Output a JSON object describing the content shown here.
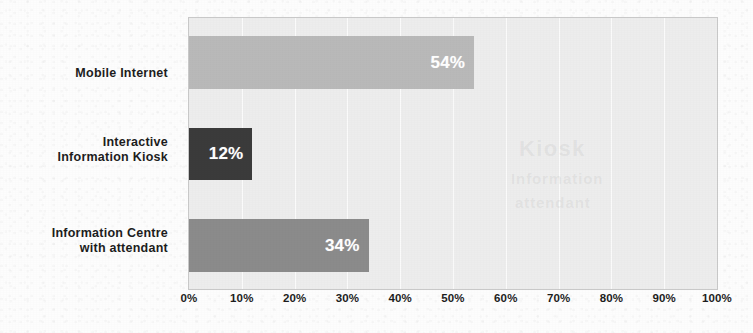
{
  "chart_data": {
    "type": "bar",
    "orientation": "horizontal",
    "title": "",
    "subtitle": "",
    "xlabel": "",
    "ylabel": "",
    "xlim": [
      0,
      100
    ],
    "xtick_labels": [
      "0%",
      "10%",
      "20%",
      "30%",
      "40%",
      "50%",
      "60%",
      "70%",
      "80%",
      "90%",
      "100%"
    ],
    "xtick_values": [
      0,
      10,
      20,
      30,
      40,
      50,
      60,
      70,
      80,
      90,
      100
    ],
    "grid": true,
    "grid_axis": "x",
    "legend": false,
    "legend_position": "none",
    "categories": [
      "Mobile Internet",
      "Interactive Information Kiosk",
      "Information Centre with attendant"
    ],
    "values": [
      54,
      12,
      34
    ],
    "data_labels": [
      "54%",
      "12%",
      "34%"
    ],
    "bars": [
      {
        "category_lines": [
          "Mobile Internet"
        ],
        "value": 54,
        "label": "54%",
        "color": "#b9b9b9",
        "label_color": "#ffffff"
      },
      {
        "category_lines": [
          "Interactive",
          "Information Kiosk"
        ],
        "value": 12,
        "label": "12%",
        "color": "#3b3b3b",
        "label_color": "#ffffff"
      },
      {
        "category_lines": [
          "Information Centre",
          "with attendant"
        ],
        "value": 34,
        "label": "34%",
        "color": "#8b8b8b",
        "label_color": "#ffffff"
      }
    ],
    "colors": {
      "plot_background": "#ededed",
      "page_background": "#fdfdfd",
      "gridline": "#fbfbfb",
      "axis_border": "#c9c9c9",
      "tick_text": "#1d1d1d",
      "category_text": "#1d1d1d"
    },
    "ghost_text": [
      "Kiosk",
      "Information",
      "attendant"
    ]
  }
}
